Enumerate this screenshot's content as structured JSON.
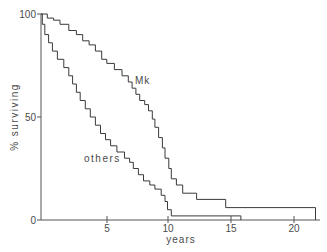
{
  "chart_data": {
    "type": "line",
    "step": true,
    "title": "",
    "xlabel": "years",
    "ylabel": "% surviving",
    "xlim": [
      0,
      21.7
    ],
    "ylim": [
      0,
      100
    ],
    "grid": false,
    "legend": "inline labels",
    "x_ticks": [
      5,
      10,
      15,
      20
    ],
    "y_ticks": [
      0,
      50,
      100
    ],
    "annotations": [
      {
        "text": "Mk",
        "x": 7.3,
        "y": 68
      },
      {
        "text": "others",
        "x": 3.3,
        "y": 40
      }
    ],
    "series": [
      {
        "name": "Mk",
        "points": [
          [
            0,
            100
          ],
          [
            0.5,
            98
          ],
          [
            1.0,
            97
          ],
          [
            1.5,
            95
          ],
          [
            2.2,
            92
          ],
          [
            2.8,
            90
          ],
          [
            3.3,
            87
          ],
          [
            3.8,
            85
          ],
          [
            4.3,
            82
          ],
          [
            4.8,
            78
          ],
          [
            5.2,
            76
          ],
          [
            5.8,
            73
          ],
          [
            6.4,
            70
          ],
          [
            6.9,
            67
          ],
          [
            7.2,
            64
          ],
          [
            7.5,
            61
          ],
          [
            7.8,
            58
          ],
          [
            8.2,
            56
          ],
          [
            8.5,
            53
          ],
          [
            8.8,
            49
          ],
          [
            9.0,
            45
          ],
          [
            9.3,
            40
          ],
          [
            9.6,
            35
          ],
          [
            9.8,
            30
          ],
          [
            10.1,
            25
          ],
          [
            10.3,
            20
          ],
          [
            10.7,
            17
          ],
          [
            11.2,
            13
          ],
          [
            12.3,
            10
          ],
          [
            14.6,
            6
          ],
          [
            21.7,
            0
          ]
        ]
      },
      {
        "name": "others",
        "points": [
          [
            0,
            100
          ],
          [
            0.1,
            95
          ],
          [
            0.3,
            90
          ],
          [
            0.6,
            86
          ],
          [
            0.9,
            82
          ],
          [
            1.3,
            78
          ],
          [
            1.8,
            74
          ],
          [
            2.2,
            70
          ],
          [
            2.5,
            66
          ],
          [
            2.8,
            62
          ],
          [
            3.1,
            58
          ],
          [
            3.5,
            54
          ],
          [
            3.9,
            50
          ],
          [
            4.3,
            46
          ],
          [
            4.7,
            42
          ],
          [
            5.1,
            39
          ],
          [
            5.5,
            36
          ],
          [
            6.0,
            33
          ],
          [
            6.6,
            30
          ],
          [
            7.0,
            28
          ],
          [
            7.3,
            25
          ],
          [
            7.7,
            22
          ],
          [
            8.1,
            19
          ],
          [
            8.6,
            17
          ],
          [
            9.0,
            15
          ],
          [
            9.5,
            12
          ],
          [
            9.8,
            9
          ],
          [
            10.0,
            5
          ],
          [
            10.3,
            2
          ],
          [
            15.8,
            0
          ]
        ]
      }
    ]
  },
  "labels": {
    "y_axis_title": "% surviving",
    "x_axis_title": "years",
    "y_tick_100": "100",
    "y_tick_50": "50",
    "y_tick_0": "0",
    "x_tick_5": "5",
    "x_tick_10": "10",
    "x_tick_15": "15",
    "x_tick_20": "20",
    "series_mk": "Mk",
    "series_others": "others"
  },
  "colors": {
    "line": "#3a3a3a",
    "axis": "#555555",
    "text": "#4a4a4a",
    "background": "#ffffff"
  }
}
